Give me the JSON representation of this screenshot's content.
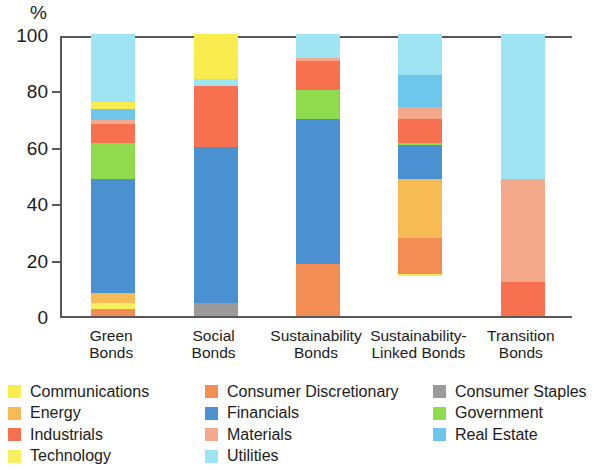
{
  "axis": {
    "unit_label": "%",
    "yticks": [
      "100",
      "80",
      "60",
      "40",
      "20",
      "0"
    ],
    "ymin": 0,
    "ymax": 100
  },
  "legend": {
    "columns": [
      [
        {
          "label": "Communications",
          "color": "#f9ec4f"
        },
        {
          "label": "Energy",
          "color": "#f7bb55"
        },
        {
          "label": "Industrials",
          "color": "#f7704f"
        },
        {
          "label": "Technology",
          "color": "#f7ef5e"
        }
      ],
      [
        {
          "label": "Consumer Discretionary",
          "color": "#f28d53"
        },
        {
          "label": "Financials",
          "color": "#4b90d1"
        },
        {
          "label": "Materials",
          "color": "#f5a98c"
        },
        {
          "label": "Utilities",
          "color": "#9fe4f2"
        }
      ],
      [
        {
          "label": "Consumer Staples",
          "color": "#9b9b9b"
        },
        {
          "label": "Government",
          "color": "#8fda4d"
        },
        {
          "label": "Real Estate",
          "color": "#6ec7ea"
        }
      ]
    ]
  },
  "chart_data": {
    "type": "bar",
    "subtype": "stacked-100",
    "title": "",
    "xlabel": "",
    "ylabel": "%",
    "ylim": [
      0,
      100
    ],
    "grid": false,
    "legend_position": "bottom",
    "categories": [
      "Green\nBonds",
      "Social\nBonds",
      "Sustainability\nBonds",
      "Sustainability-\nLinked Bonds",
      "Transition\nBonds"
    ],
    "category_labels": [
      {
        "line1": "Green",
        "line2": "Bonds"
      },
      {
        "line1": "Social",
        "line2": "Bonds"
      },
      {
        "line1": "Sustainability",
        "line2": "Bonds"
      },
      {
        "line1": "Sustainability-",
        "line2": "Linked Bonds"
      },
      {
        "line1": "Transition",
        "line2": "Bonds"
      }
    ],
    "series": [
      {
        "name": "Communications",
        "color": "#f9ec4f",
        "values": [
          0,
          16.0,
          0,
          0,
          0
        ]
      },
      {
        "name": "Energy",
        "color": "#f7bb55",
        "values": [
          3.5,
          0,
          0,
          21.0,
          0
        ]
      },
      {
        "name": "Industrials",
        "color": "#f7704f",
        "values": [
          0,
          0,
          0,
          0,
          12.0
        ]
      },
      {
        "name": "Technology",
        "color": "#f7ef5e",
        "values": [
          2.0,
          0,
          0,
          1.0,
          0
        ]
      },
      {
        "name": "Consumer Discretionary",
        "color": "#f28d53",
        "values": [
          6.5,
          22.5,
          18.5,
          22.5,
          0
        ]
      },
      {
        "name": "Financials",
        "color": "#4b90d1",
        "values": [
          41.0,
          55.0,
          51.5,
          12.0,
          0
        ]
      },
      {
        "name": "Materials",
        "color": "#f5a98c",
        "values": [
          1.5,
          0,
          1.0,
          4.0,
          36.5
        ]
      },
      {
        "name": "Utilities",
        "color": "#9fe4f2",
        "values": [
          24.5,
          2.0,
          8.5,
          14.5,
          51.5
        ]
      },
      {
        "name": "Consumer Staples",
        "color": "#9b9b9b",
        "values": [
          0,
          4.5,
          0,
          0,
          0
        ]
      },
      {
        "name": "Government",
        "color": "#8fda4d",
        "values": [
          13.0,
          0,
          10.0,
          1.0,
          0
        ]
      },
      {
        "name": "Real Estate",
        "color": "#6ec7ea",
        "values": [
          3.5,
          0,
          0,
          11.5,
          0
        ]
      }
    ],
    "stack_order_bottom_to_top": [
      [
        "Consumer Discretionary",
        "Energy",
        "Financials",
        "Government",
        "Industrials",
        "Materials",
        "Real Estate",
        "Technology",
        "Utilities"
      ]
    ],
    "bars": [
      {
        "category": "Green Bonds",
        "segments": [
          {
            "name": "Consumer Discretionary",
            "color": "#f28d53",
            "value": 2.5
          },
          {
            "name": "Technology",
            "color": "#f7ef5e",
            "value": 2.0
          },
          {
            "name": "Energy",
            "color": "#f7bb55",
            "value": 3.5
          },
          {
            "name": "Financials",
            "color": "#4b90d1",
            "value": 40.5
          },
          {
            "name": "Government",
            "color": "#8fda4d",
            "value": 13.0
          },
          {
            "name": "Industrials",
            "color": "#f7704f",
            "value": 6.5
          },
          {
            "name": "Materials",
            "color": "#f5a98c",
            "value": 1.5
          },
          {
            "name": "Real Estate",
            "color": "#6ec7ea",
            "value": 4.0
          },
          {
            "name": "Communications",
            "color": "#f9ec4f",
            "value": 2.5
          },
          {
            "name": "Utilities",
            "color": "#9fe4f2",
            "value": 24.0
          }
        ]
      },
      {
        "category": "Social Bonds",
        "segments": [
          {
            "name": "Consumer Staples",
            "color": "#9b9b9b",
            "value": 4.5
          },
          {
            "name": "Financials",
            "color": "#4b90d1",
            "value": 55.5
          },
          {
            "name": "Industrials",
            "color": "#f7704f",
            "value": 21.5
          },
          {
            "name": "Utilities",
            "color": "#9fe4f2",
            "value": 2.5
          },
          {
            "name": "Communications",
            "color": "#f9ec4f",
            "value": 16.0
          }
        ]
      },
      {
        "category": "Sustainability Bonds",
        "segments": [
          {
            "name": "Consumer Discretionary",
            "color": "#f28d53",
            "value": 18.5
          },
          {
            "name": "Financials",
            "color": "#4b90d1",
            "value": 51.5
          },
          {
            "name": "Government",
            "color": "#8fda4d",
            "value": 10.0
          },
          {
            "name": "Industrials",
            "color": "#f7704f",
            "value": 10.5
          },
          {
            "name": "Materials",
            "color": "#f5a98c",
            "value": 1.0
          },
          {
            "name": "Utilities",
            "color": "#9fe4f2",
            "value": 8.5
          }
        ]
      },
      {
        "category": "Sustainability-Linked Bonds",
        "segments": [
          {
            "name": "Technology",
            "color": "#f7ef5e",
            "value": 1.0
          },
          {
            "name": "Consumer Discretionary",
            "color": "#f28d53",
            "value": 12.5
          },
          {
            "name": "Energy",
            "color": "#f7bb55",
            "value": 21.0
          },
          {
            "name": "Financials",
            "color": "#4b90d1",
            "value": 12.0
          },
          {
            "name": "Government",
            "color": "#8fda4d",
            "value": 1.0
          },
          {
            "name": "Industrials",
            "color": "#f7704f",
            "value": 8.5
          },
          {
            "name": "Materials",
            "color": "#f5a98c",
            "value": 4.0
          },
          {
            "name": "Real Estate",
            "color": "#6ec7ea",
            "value": 11.5
          },
          {
            "name": "Utilities",
            "color": "#9fe4f2",
            "value": 14.5
          }
        ]
      },
      {
        "category": "Transition Bonds",
        "segments": [
          {
            "name": "Industrials",
            "color": "#f7704f",
            "value": 12.0
          },
          {
            "name": "Materials",
            "color": "#f5a98c",
            "value": 36.5
          },
          {
            "name": "Utilities",
            "color": "#9fe4f2",
            "value": 51.5
          }
        ]
      }
    ]
  }
}
